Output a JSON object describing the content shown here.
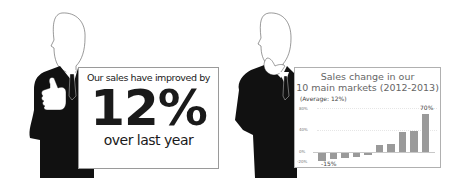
{
  "left_panel": {
    "sign": {
      "line1": "Our sales have improved by",
      "big": "12%",
      "line3": "over last year"
    },
    "figure": "businessman-thumbs-up"
  },
  "right_panel": {
    "figure": "businessman-thinking",
    "sign": {
      "title_line1": "Sales change in our",
      "title_line2": "10 main markets (2012-2013)",
      "subtitle": "(Average: 12%)"
    }
  },
  "chart_data": {
    "type": "bar",
    "title": "Sales change in our 10 main markets (2012-2013)",
    "subtitle": "(Average: 12%)",
    "categories": [
      "M1",
      "M2",
      "M3",
      "M4",
      "M5",
      "M6",
      "M7",
      "M8",
      "M9",
      "M10"
    ],
    "values": [
      -15,
      -11,
      -9,
      -7,
      -3,
      12,
      15,
      37,
      38,
      70
    ],
    "yticks": [
      "80%",
      "40%",
      "0%",
      "-20%"
    ],
    "ylim": [
      -20,
      80
    ],
    "annotations": [
      {
        "bar": 0,
        "text": "-15%"
      },
      {
        "bar": 9,
        "text": "70%"
      }
    ],
    "xlabel": "",
    "ylabel": "",
    "grid": true,
    "legend": "none"
  }
}
